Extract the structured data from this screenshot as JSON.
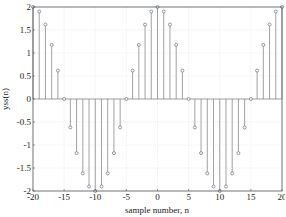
{
  "chart_data": {
    "type": "stem",
    "title": "",
    "xlabel": "sample number, n",
    "ylabel": "yss(n)",
    "xlim": [
      -20,
      20
    ],
    "ylim": [
      -2,
      2
    ],
    "grid": true,
    "xticks": [
      -20,
      -15,
      -10,
      -5,
      0,
      5,
      10,
      15,
      20
    ],
    "yticks": [
      -2,
      -1.5,
      -1,
      -0.5,
      0,
      0.5,
      1,
      1.5,
      2
    ],
    "ytick_labels": [
      "-2",
      "-1.5",
      "-1",
      "-0.5",
      "0",
      "0.5",
      "1",
      "1.5",
      "2"
    ],
    "x": [
      -20,
      -19,
      -18,
      -17,
      -16,
      -15,
      -14,
      -13,
      -12,
      -11,
      -10,
      -9,
      -8,
      -7,
      -6,
      -5,
      -4,
      -3,
      -2,
      -1,
      0,
      1,
      2,
      3,
      4,
      5,
      6,
      7,
      8,
      9,
      10,
      11,
      12,
      13,
      14,
      15,
      16,
      17,
      18,
      19,
      20
    ],
    "values": [
      2,
      1.902,
      1.618,
      1.176,
      0.618,
      0,
      -0.618,
      -1.176,
      -1.618,
      -1.902,
      -2,
      -1.902,
      -1.618,
      -1.176,
      -0.618,
      0,
      0.618,
      1.176,
      1.618,
      1.902,
      2,
      1.902,
      1.618,
      1.176,
      0.618,
      0,
      -0.618,
      -1.176,
      -1.618,
      -1.902,
      -2,
      -1.902,
      -1.618,
      -1.176,
      -0.618,
      0,
      0.618,
      1.176,
      1.618,
      1.902,
      2
    ],
    "stem_color": "#8a8a8a",
    "marker_color": "#6f7f95"
  }
}
